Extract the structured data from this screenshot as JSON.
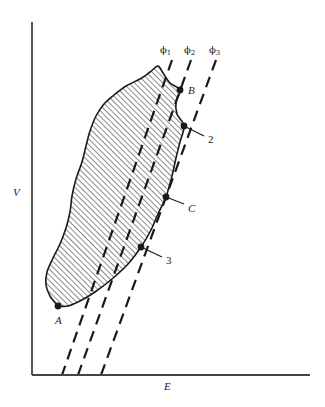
{
  "figure": {
    "type": "diagram",
    "background_color": "#ffffff",
    "ink_color": "#1a1a1a"
  },
  "axes": {
    "x_label": "E",
    "y_label": "V",
    "x_axis": {
      "x_start": 32,
      "x_end": 310,
      "y": 375
    },
    "y_axis": {
      "x": 32,
      "y_start": 22,
      "y_end": 375
    },
    "ticks": "none",
    "grid": false
  },
  "region": {
    "name": "shaded-stability-region",
    "fill": "diagonal-hatch",
    "hatch_color": "#1a1a1a",
    "hatch_angle_deg": 45,
    "outline_color": "#1a1a1a"
  },
  "phi_lines": [
    {
      "label": "ϕ",
      "sub": "1",
      "label_x": 160,
      "label_y": 44,
      "top_x": 172,
      "top_y": 60,
      "bottom_x": 62,
      "bottom_y": 375
    },
    {
      "label": "ϕ",
      "sub": "2",
      "label_x": 184,
      "label_y": 44,
      "top_x": 191,
      "top_y": 60,
      "bottom_x": 78,
      "bottom_y": 375
    },
    {
      "label": "ϕ",
      "sub": "3",
      "label_x": 209,
      "label_y": 44,
      "top_x": 216,
      "top_y": 60,
      "bottom_x": 101,
      "bottom_y": 375
    }
  ],
  "points": [
    {
      "id": "A",
      "label": "A",
      "italic": true,
      "dot_x": 58,
      "dot_y": 306,
      "label_x": 55,
      "label_y": 314,
      "leader": false
    },
    {
      "id": "B",
      "label": "B",
      "italic": true,
      "dot_x": 180,
      "dot_y": 90,
      "label_x": 188,
      "label_y": 84,
      "leader": false
    },
    {
      "id": "C",
      "label": "C",
      "italic": true,
      "dot_x": 166,
      "dot_y": 197,
      "label_x": 188,
      "label_y": 202,
      "leader": true,
      "leader_to_x": 184,
      "leader_to_y": 204
    },
    {
      "id": "2",
      "label": "2",
      "italic": false,
      "dot_x": 184,
      "dot_y": 126,
      "label_x": 208,
      "label_y": 133,
      "leader": true,
      "leader_to_x": 204,
      "leader_to_y": 136
    },
    {
      "id": "3",
      "label": "3",
      "italic": false,
      "dot_x": 141,
      "dot_y": 247,
      "label_x": 166,
      "label_y": 254,
      "leader": true,
      "leader_to_x": 162,
      "leader_to_y": 257
    }
  ],
  "chart_data": {
    "type": "line",
    "title": "",
    "xlabel": "E",
    "ylabel": "V",
    "grid": false,
    "legend": "none",
    "annotations": [
      "ϕ1",
      "ϕ2",
      "ϕ3",
      "A",
      "B",
      "C",
      "2",
      "3"
    ],
    "series": [
      {
        "name": "region-boundary",
        "style": "solid-closed-hatched",
        "points": [
          [
            58,
            306
          ],
          [
            50,
            296
          ],
          [
            46,
            285
          ],
          [
            47,
            272
          ],
          [
            53,
            258
          ],
          [
            60,
            244
          ],
          [
            66,
            228
          ],
          [
            70,
            212
          ],
          [
            72,
            196
          ],
          [
            76,
            179
          ],
          [
            82,
            162
          ],
          [
            86,
            146
          ],
          [
            90,
            131
          ],
          [
            96,
            116
          ],
          [
            104,
            104
          ],
          [
            114,
            95
          ],
          [
            126,
            86
          ],
          [
            140,
            79
          ],
          [
            150,
            72
          ],
          [
            158,
            66
          ],
          [
            163,
            73
          ],
          [
            170,
            83
          ],
          [
            180,
            90
          ],
          [
            176,
            102
          ],
          [
            177,
            114
          ],
          [
            184,
            126
          ],
          [
            180,
            142
          ],
          [
            176,
            158
          ],
          [
            172,
            176
          ],
          [
            166,
            197
          ],
          [
            158,
            214
          ],
          [
            151,
            230
          ],
          [
            141,
            247
          ],
          [
            128,
            264
          ],
          [
            112,
            279
          ],
          [
            95,
            292
          ],
          [
            80,
            301
          ],
          [
            68,
            306
          ],
          [
            58,
            306
          ]
        ]
      },
      {
        "name": "phi-1",
        "style": "dashed",
        "points": [
          [
            172,
            60
          ],
          [
            62,
            375
          ]
        ]
      },
      {
        "name": "phi-2",
        "style": "dashed",
        "points": [
          [
            191,
            60
          ],
          [
            78,
            375
          ]
        ]
      },
      {
        "name": "phi-3",
        "style": "dashed",
        "points": [
          [
            216,
            60
          ],
          [
            101,
            375
          ]
        ]
      }
    ]
  }
}
